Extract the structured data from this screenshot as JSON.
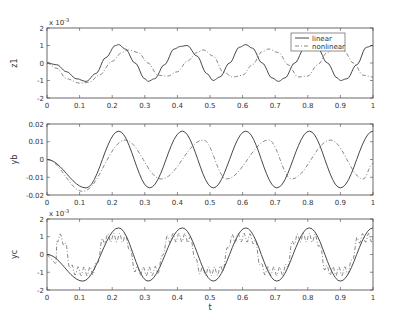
{
  "chart_data": [
    {
      "type": "line",
      "ylabel": "z1",
      "xlabel": "",
      "y_multiplier": "x 10^-3",
      "xlim": [
        0,
        1
      ],
      "ylim": [
        -2,
        2
      ],
      "yticks": [
        "2",
        "1",
        "0",
        "-1",
        "-2"
      ],
      "xticks": [
        "0",
        "0.1",
        "0.2",
        "0.3",
        "0.4",
        "0.5",
        "0.6",
        "0.7",
        "0.8",
        "0.9",
        "1"
      ],
      "legend": {
        "position": "upper right",
        "entries": [
          "linear",
          "nonlinear"
        ]
      },
      "series": [
        {
          "name": "linear",
          "style": "solid",
          "x": [
            0,
            0.03,
            0.06,
            0.09,
            0.12,
            0.15,
            0.18,
            0.21,
            0.22,
            0.24,
            0.27,
            0.3,
            0.31,
            0.33,
            0.36,
            0.39,
            0.41,
            0.43,
            0.46,
            0.49,
            0.51,
            0.53,
            0.56,
            0.59,
            0.61,
            0.63,
            0.66,
            0.69,
            0.71,
            0.73,
            0.76,
            0.79,
            0.81,
            0.83,
            0.86,
            0.89,
            0.9,
            0.92,
            0.95,
            0.98,
            1.0
          ],
          "y": [
            0,
            -0.1,
            -0.5,
            -0.9,
            -1.05,
            -0.6,
            0.3,
            1.0,
            1.05,
            0.8,
            0.0,
            -0.9,
            -1.05,
            -0.9,
            -0.1,
            0.8,
            0.95,
            1.0,
            0.4,
            -0.6,
            -1.0,
            -0.8,
            0.0,
            0.9,
            1.05,
            0.85,
            0.0,
            -0.85,
            -1.05,
            -0.85,
            0.0,
            0.85,
            1.05,
            0.85,
            0.0,
            -0.85,
            -1.0,
            -0.9,
            -0.1,
            0.9,
            1.0
          ]
        },
        {
          "name": "nonlinear",
          "style": "dashdot",
          "x": [
            0,
            0.03,
            0.06,
            0.1,
            0.13,
            0.16,
            0.2,
            0.23,
            0.25,
            0.28,
            0.31,
            0.34,
            0.37,
            0.4,
            0.43,
            0.46,
            0.48,
            0.51,
            0.54,
            0.57,
            0.6,
            0.63,
            0.66,
            0.68,
            0.71,
            0.74,
            0.77,
            0.8,
            0.83,
            0.86,
            0.88,
            0.91,
            0.94,
            0.97,
            1.0
          ],
          "y": [
            0,
            -0.3,
            -0.9,
            -1.15,
            -1.1,
            -0.7,
            0.1,
            0.6,
            0.75,
            0.6,
            0.0,
            -0.7,
            -0.75,
            -0.5,
            0.1,
            0.6,
            0.75,
            0.4,
            -0.5,
            -0.8,
            -0.7,
            -0.1,
            0.65,
            0.8,
            0.6,
            -0.1,
            -0.8,
            -0.75,
            -0.1,
            0.6,
            0.8,
            0.7,
            0.0,
            -0.7,
            -0.8
          ]
        }
      ]
    },
    {
      "type": "line",
      "ylabel": "yb",
      "xlabel": "",
      "xlim": [
        0,
        1
      ],
      "ylim": [
        -0.02,
        0.02
      ],
      "yticks": [
        "0.02",
        "0.01",
        "0",
        "-0.01",
        "-0.02"
      ],
      "xticks": [
        "0",
        "0.1",
        "0.2",
        "0.3",
        "0.4",
        "0.5",
        "0.6",
        "0.7",
        "0.8",
        "0.9",
        "1"
      ],
      "series": [
        {
          "name": "linear",
          "style": "solid",
          "amplitude": 0.016,
          "peaks_t": [
            0.22,
            0.415,
            0.61,
            0.805,
            1.0
          ],
          "troughs_t": [
            0.12,
            0.315,
            0.51,
            0.705,
            0.9
          ]
        },
        {
          "name": "nonlinear",
          "style": "dashdot",
          "amplitude": 0.011,
          "peaks_t": [
            0.24,
            0.48,
            0.68,
            0.87
          ],
          "troughs_t": [
            0.11,
            0.35,
            0.55,
            0.75,
            0.97
          ],
          "first_trough": -0.018
        }
      ]
    },
    {
      "type": "line",
      "ylabel": "yc",
      "xlabel": "t",
      "y_multiplier": "x 10^-3",
      "xlim": [
        0,
        1
      ],
      "ylim": [
        -2,
        2
      ],
      "yticks": [
        "2",
        "1",
        "0",
        "-1",
        "-2"
      ],
      "xticks": [
        "0",
        "0.1",
        "0.2",
        "0.3",
        "0.4",
        "0.5",
        "0.6",
        "0.7",
        "0.8",
        "0.9",
        "1"
      ],
      "series": [
        {
          "name": "linear",
          "style": "solid",
          "amplitude": 1.5,
          "peaks_t": [
            0.22,
            0.415,
            0.61,
            0.805,
            1.0
          ],
          "troughs_t": [
            0.11,
            0.31,
            0.51,
            0.705,
            0.9
          ]
        },
        {
          "name": "nonlinear",
          "style": "dashdot",
          "amplitude": 1.0,
          "note": "square-ish wave with high-frequency ripple, values between about -1.2 and 1.1"
        }
      ]
    }
  ],
  "legend": {
    "linear": "linear",
    "nonlinear": "nonlinear"
  },
  "axis_labels": {
    "z1": "z1",
    "yb": "yb",
    "yc": "yc",
    "t": "t",
    "multiplier_base": "x 10",
    "multiplier_exp": "-3"
  }
}
